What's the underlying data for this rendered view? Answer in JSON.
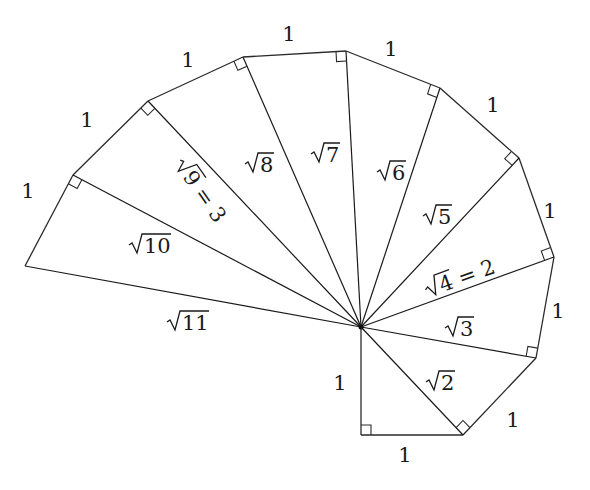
{
  "center": [
    361,
    327
  ],
  "vertices": [
    [
      361,
      435
    ],
    [
      463,
      435
    ],
    [
      536,
      358
    ],
    [
      554,
      257
    ],
    [
      519,
      158
    ],
    [
      440,
      88
    ],
    [
      346,
      51
    ],
    [
      243,
      57
    ],
    [
      148,
      101
    ],
    [
      73,
      175
    ],
    [
      25,
      266
    ]
  ],
  "unit_labels": [
    {
      "text": "1",
      "x": 405,
      "y": 462
    },
    {
      "text": "1",
      "x": 340,
      "y": 390
    },
    {
      "text": "1",
      "x": 513,
      "y": 427
    },
    {
      "text": "1",
      "x": 558,
      "y": 318
    },
    {
      "text": "1",
      "x": 550,
      "y": 218
    },
    {
      "text": "1",
      "x": 493,
      "y": 112
    },
    {
      "text": "1",
      "x": 391,
      "y": 56
    },
    {
      "text": "1",
      "x": 289,
      "y": 41
    },
    {
      "text": "1",
      "x": 188,
      "y": 67
    },
    {
      "text": "1",
      "x": 87,
      "y": 127
    },
    {
      "text": "1",
      "x": 28,
      "y": 198
    }
  ],
  "hypotenuse_labels": [
    {
      "radicand": "2",
      "suffix": "",
      "x": 430,
      "y": 390,
      "rotate": 0
    },
    {
      "radicand": "3",
      "suffix": "",
      "x": 449,
      "y": 336,
      "rotate": 0
    },
    {
      "radicand": "4",
      "suffix": " = 2",
      "x": 432,
      "y": 296,
      "rotate": -20
    },
    {
      "radicand": "5",
      "suffix": "",
      "x": 427,
      "y": 224,
      "rotate": 0
    },
    {
      "radicand": "6",
      "suffix": "",
      "x": 381,
      "y": 180,
      "rotate": 0
    },
    {
      "radicand": "7",
      "suffix": "",
      "x": 315,
      "y": 162,
      "rotate": 0
    },
    {
      "radicand": "8",
      "suffix": "",
      "x": 249,
      "y": 172,
      "rotate": 0
    },
    {
      "radicand": "9",
      "suffix": " = 3",
      "x": 176,
      "y": 168,
      "rotate": 55
    },
    {
      "radicand": "10",
      "suffix": "",
      "x": 133,
      "y": 253,
      "rotate": 0
    },
    {
      "radicand": "11",
      "suffix": "",
      "x": 171,
      "y": 330,
      "rotate": 0
    }
  ]
}
